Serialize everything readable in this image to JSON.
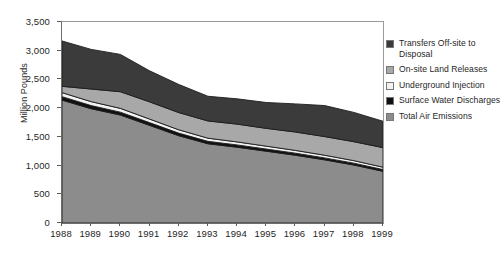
{
  "chart_data": {
    "type": "area",
    "title": "",
    "subtitle": "",
    "xlabel": "",
    "ylabel": "Million Pounds",
    "stacked": true,
    "grid": false,
    "legend_position": "right",
    "xlim": [
      1988,
      1999
    ],
    "ylim": [
      0,
      3500
    ],
    "y_ticks": [
      0,
      500,
      1000,
      1500,
      2000,
      2500,
      3000,
      3500
    ],
    "y_tick_labels": [
      "0",
      "500",
      "1,000",
      "1,500",
      "2,000",
      "2,500",
      "3,000",
      "3,500"
    ],
    "categories": [
      1988,
      1989,
      1990,
      1991,
      1992,
      1993,
      1994,
      1995,
      1996,
      1997,
      1998,
      1999
    ],
    "x_tick_labels": [
      "1988",
      "1989",
      "1990",
      "1991",
      "1992",
      "1993",
      "1994",
      "1995",
      "1996",
      "1997",
      "1998",
      "1999"
    ],
    "series": [
      {
        "name": "Total Air Emissions",
        "color": "#8c8c8c",
        "stack_order": 1,
        "values": [
          2140,
          1990,
          1880,
          1700,
          1520,
          1380,
          1320,
          1250,
          1180,
          1100,
          1010,
          900
        ]
      },
      {
        "name": "Surface Water Discharges",
        "color": "#101010",
        "stack_order": 2,
        "values": [
          60,
          55,
          50,
          48,
          45,
          42,
          40,
          38,
          36,
          34,
          32,
          30
        ]
      },
      {
        "name": "Underground Injection",
        "color": "#f2f2f2",
        "stack_order": 3,
        "values": [
          70,
          68,
          66,
          62,
          58,
          55,
          52,
          50,
          48,
          46,
          44,
          42
        ]
      },
      {
        "name": "On-site Land Releases",
        "color": "#a8a8a8",
        "stack_order": 4,
        "values": [
          110,
          220,
          290,
          300,
          300,
          300,
          310,
          310,
          320,
          325,
          330,
          340
        ]
      },
      {
        "name": "Transfers Off-site to Disposal",
        "color": "#3b3b3b",
        "stack_order": 5,
        "values": [
          790,
          690,
          650,
          540,
          490,
          430,
          440,
          450,
          490,
          540,
          510,
          460
        ]
      }
    ],
    "stack_totals": [
      3170,
      3023,
      2936,
      2650,
      2413,
      2207,
      2162,
      2098,
      2074,
      2045,
      1926,
      1772
    ]
  },
  "legend": {
    "items": [
      {
        "label": "Transfers Off-site to Disposal",
        "color": "#3b3b3b"
      },
      {
        "label": "On-site Land Releases",
        "color": "#a8a8a8"
      },
      {
        "label": "Underground Injection",
        "color": "#f2f2f2"
      },
      {
        "label": "Surface Water Discharges",
        "color": "#101010"
      },
      {
        "label": "Total Air Emissions",
        "color": "#8c8c8c"
      }
    ]
  },
  "axes": {
    "y_title": "Million Pounds"
  }
}
